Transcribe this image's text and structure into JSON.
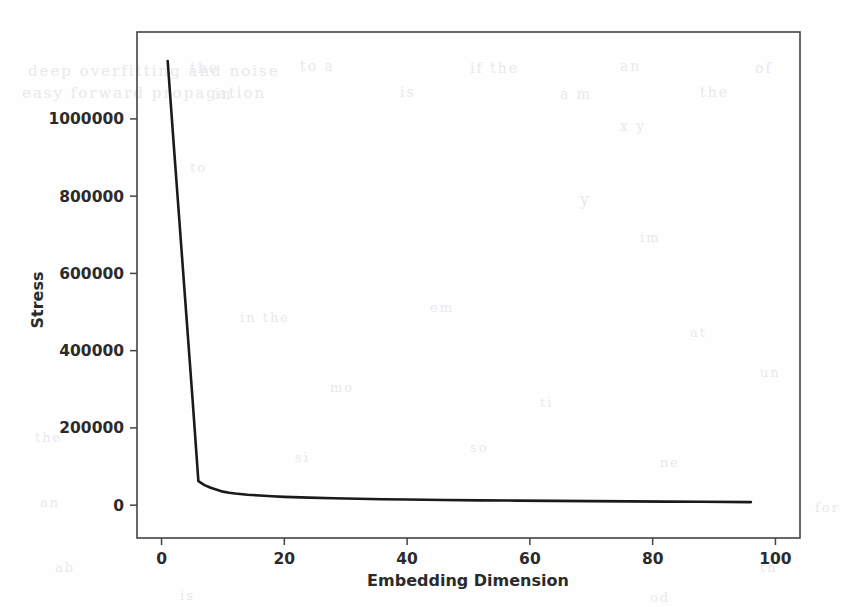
{
  "figure": {
    "background_color": "#fefefe",
    "line_color": "#1a1a1a",
    "axis_color": "#444444"
  },
  "axis_titles": {
    "x": "Embedding Dimension",
    "y": "Stress"
  },
  "x_ticks": [
    "0",
    "20",
    "40",
    "60",
    "80",
    "100"
  ],
  "y_ticks": [
    "0",
    "200000",
    "400000",
    "600000",
    "800000",
    "1000000"
  ],
  "ghost_text": [
    {
      "t": "deep overfitting and noise",
      "x": 28,
      "y": 62,
      "size": 15,
      "rot": 0
    },
    {
      "t": "easy forward propagation",
      "x": 22,
      "y": 84,
      "size": 15,
      "rot": 0
    },
    {
      "t": "the",
      "x": 190,
      "y": 60,
      "size": 14,
      "rot": 0
    },
    {
      "t": "to a",
      "x": 300,
      "y": 58,
      "size": 14,
      "rot": 0
    },
    {
      "t": "if the",
      "x": 470,
      "y": 60,
      "size": 14,
      "rot": 0
    },
    {
      "t": "an",
      "x": 620,
      "y": 58,
      "size": 14,
      "rot": 0
    },
    {
      "t": "of",
      "x": 755,
      "y": 60,
      "size": 14,
      "rot": 0
    },
    {
      "t": "in",
      "x": 215,
      "y": 86,
      "size": 14,
      "rot": 0
    },
    {
      "t": "is",
      "x": 400,
      "y": 84,
      "size": 14,
      "rot": 0
    },
    {
      "t": "a m",
      "x": 560,
      "y": 86,
      "size": 14,
      "rot": 0
    },
    {
      "t": "the",
      "x": 700,
      "y": 84,
      "size": 14,
      "rot": 0
    },
    {
      "t": "x y",
      "x": 620,
      "y": 118,
      "size": 14,
      "rot": 0
    },
    {
      "t": "y",
      "x": 580,
      "y": 190,
      "size": 16,
      "rot": 0
    },
    {
      "t": "to",
      "x": 190,
      "y": 160,
      "size": 13,
      "rot": 0
    },
    {
      "t": "im",
      "x": 640,
      "y": 230,
      "size": 13,
      "rot": 0
    },
    {
      "t": "in the",
      "x": 240,
      "y": 310,
      "size": 13,
      "rot": 0
    },
    {
      "t": "em",
      "x": 430,
      "y": 300,
      "size": 13,
      "rot": 0
    },
    {
      "t": "at",
      "x": 690,
      "y": 325,
      "size": 13,
      "rot": 0
    },
    {
      "t": "mo",
      "x": 330,
      "y": 380,
      "size": 13,
      "rot": 0
    },
    {
      "t": "ti",
      "x": 540,
      "y": 395,
      "size": 13,
      "rot": 0
    },
    {
      "t": "un",
      "x": 760,
      "y": 365,
      "size": 13,
      "rot": 0
    },
    {
      "t": "the",
      "x": 35,
      "y": 430,
      "size": 13,
      "rot": 0
    },
    {
      "t": "si",
      "x": 295,
      "y": 450,
      "size": 13,
      "rot": 0
    },
    {
      "t": "so",
      "x": 470,
      "y": 440,
      "size": 13,
      "rot": 0
    },
    {
      "t": "ne",
      "x": 660,
      "y": 455,
      "size": 13,
      "rot": 0
    },
    {
      "t": "an",
      "x": 40,
      "y": 495,
      "size": 13,
      "rot": 0
    },
    {
      "t": "for",
      "x": 815,
      "y": 500,
      "size": 13,
      "rot": 0
    },
    {
      "t": "ab",
      "x": 55,
      "y": 560,
      "size": 13,
      "rot": 0
    },
    {
      "t": "th",
      "x": 760,
      "y": 560,
      "size": 13,
      "rot": 0
    },
    {
      "t": "is",
      "x": 180,
      "y": 588,
      "size": 13,
      "rot": 0
    },
    {
      "t": "od",
      "x": 650,
      "y": 590,
      "size": 13,
      "rot": 0
    }
  ],
  "chart_data": {
    "type": "line",
    "title": "",
    "xlabel": "Embedding Dimension",
    "ylabel": "Stress",
    "xlim": [
      -4,
      104
    ],
    "ylim": [
      -85000,
      1225000
    ],
    "xticks": [
      0,
      20,
      40,
      60,
      80,
      100
    ],
    "yticks": [
      0,
      200000,
      400000,
      600000,
      800000,
      1000000
    ],
    "grid": false,
    "legend": null,
    "series": [
      {
        "name": "stress",
        "x": [
          1,
          2,
          3,
          4,
          5,
          6,
          7,
          8,
          9,
          10,
          11,
          12,
          14,
          16,
          18,
          20,
          24,
          28,
          32,
          36,
          40,
          46,
          52,
          58,
          64,
          70,
          76,
          82,
          88,
          96
        ],
        "y": [
          1150000,
          930000,
          715000,
          500000,
          285000,
          62000,
          52000,
          45000,
          40000,
          35000,
          32000,
          30000,
          27000,
          25000,
          23000,
          21500,
          19500,
          18000,
          16500,
          15500,
          14500,
          13500,
          12500,
          11800,
          11000,
          10400,
          9800,
          9200,
          8700,
          8000
        ]
      }
    ]
  }
}
